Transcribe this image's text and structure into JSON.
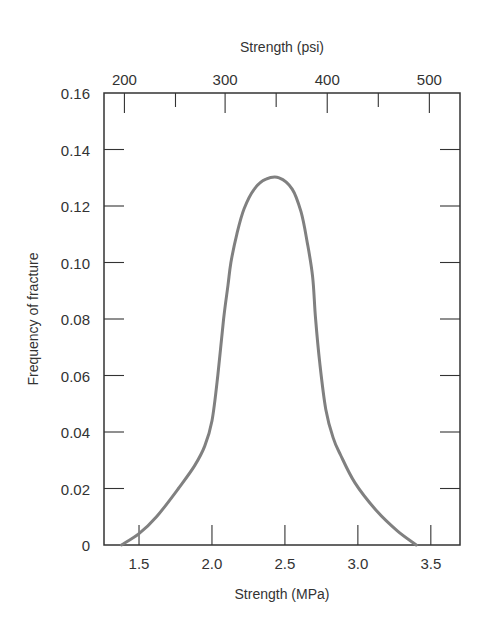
{
  "chart_data": {
    "type": "line",
    "title": "",
    "xlabel": "Strength (MPa)",
    "x2label": "Strength (psi)",
    "ylabel": "Frequency of fracture",
    "xlim": [
      1.26,
      3.7
    ],
    "ylim": [
      0,
      0.16
    ],
    "x_ticks": [
      1.5,
      2.0,
      2.5,
      3.0,
      3.5
    ],
    "x_tick_labels": [
      "1.5",
      "2.0",
      "2.5",
      "3.0",
      "3.5"
    ],
    "x2_ticks": [
      200,
      250,
      300,
      350,
      400,
      450,
      500
    ],
    "x2_tick_labels": [
      "200",
      "",
      "300",
      "",
      "400",
      "",
      "500"
    ],
    "x2_to_x_note": "top axis in psi; 200 psi aligns near 1.40 MPa, 500 psi near 3.45 MPa",
    "x2_positions_mpa": [
      1.4,
      1.75,
      2.09,
      2.44,
      2.79,
      3.14,
      3.49
    ],
    "y_ticks": [
      0,
      0.02,
      0.04,
      0.06,
      0.08,
      0.1,
      0.12,
      0.14,
      0.16
    ],
    "y_tick_labels": [
      "0",
      "0.02",
      "0.04",
      "0.06",
      "0.08",
      "0.10",
      "0.12",
      "0.14",
      "0.16"
    ],
    "grid": false,
    "legend": "none",
    "series": [
      {
        "name": "Frequency of fracture",
        "color": "#808080",
        "x": [
          1.38,
          1.5,
          1.62,
          1.77,
          1.88,
          1.95,
          2.0,
          2.04,
          2.08,
          2.11,
          2.13,
          2.17,
          2.22,
          2.29,
          2.37,
          2.46,
          2.55,
          2.61,
          2.65,
          2.69,
          2.71,
          2.74,
          2.78,
          2.83,
          2.88,
          2.98,
          3.13,
          3.27,
          3.4
        ],
        "y": [
          0.0,
          0.004,
          0.01,
          0.02,
          0.028,
          0.035,
          0.044,
          0.06,
          0.08,
          0.092,
          0.1,
          0.11,
          0.119,
          0.126,
          0.1295,
          0.13,
          0.126,
          0.118,
          0.108,
          0.095,
          0.08,
          0.064,
          0.048,
          0.038,
          0.032,
          0.022,
          0.012,
          0.005,
          0.0
        ]
      }
    ]
  }
}
